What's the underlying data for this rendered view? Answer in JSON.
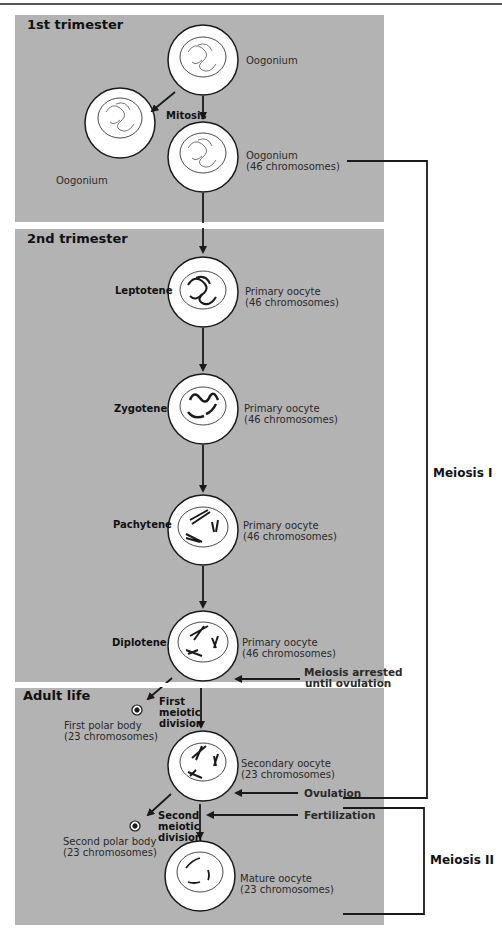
{
  "sections": [
    {
      "title": "1st trimester"
    },
    {
      "title": "2nd trimester"
    },
    {
      "title": "Adult life"
    }
  ],
  "cells": {
    "oogonium_top": {
      "name": "Oogonium"
    },
    "oogonium_left": {
      "name": "Oogonium"
    },
    "oogonium_46": {
      "name": "Oogonium",
      "count": "(46 chromosomes)"
    },
    "leptotene": {
      "stage": "Leptotene",
      "name": "Primary oocyte",
      "count": "(46 chromosomes)"
    },
    "zygotene": {
      "stage": "Zygotene",
      "name": "Primary oocyte",
      "count": "(46 chromosomes)"
    },
    "pachytene": {
      "stage": "Pachytene",
      "name": "Primary oocyte",
      "count": "(46 chromosomes)"
    },
    "diplotene": {
      "stage": "Diplotene",
      "name": "Primary oocyte",
      "count": "(46 chromosomes)"
    },
    "secondary": {
      "name": "Secondary oocyte",
      "count": "(23 chromosomes)"
    },
    "mature": {
      "name": "Mature oocyte",
      "count": "(23 chromosomes)"
    },
    "polar1": {
      "name": "First polar body",
      "count": "(23 chromosomes)"
    },
    "polar2": {
      "name": "Second polar body",
      "count": "(23 chromosomes)"
    }
  },
  "processes": {
    "mitosis": "Mitosis",
    "first_division": [
      "First",
      "meiotic",
      "division"
    ],
    "second_division": [
      "Second",
      "meiotic",
      "division"
    ]
  },
  "events": {
    "arrest": [
      "Meiosis arrested",
      "until ovulation"
    ],
    "ovulation": "Ovulation",
    "fertilization": "Fertilization"
  },
  "brackets": {
    "meiosis1": "Meiosis I",
    "meiosis2": "Meiosis II"
  },
  "colors": {
    "panel": "#b3b3b3",
    "cell": "#ffffff",
    "ink": "#1a1a1a"
  }
}
